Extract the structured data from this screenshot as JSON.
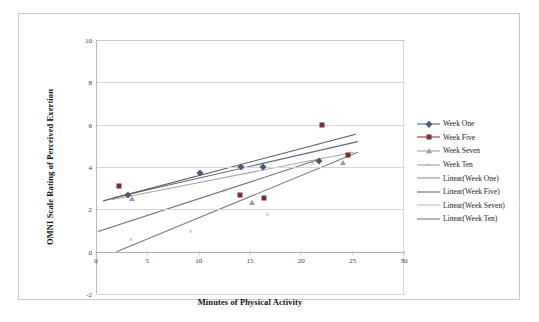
{
  "chart_data": {
    "type": "scatter",
    "title": "",
    "xlabel": "Minutes of Physical Activity",
    "ylabel": "OMNI Scale Rating of Perceived Exertion",
    "xlim": [
      0,
      30
    ],
    "ylim": [
      -2,
      10
    ],
    "xticks": [
      "0",
      "5",
      "10",
      "15",
      "20",
      "25",
      "30"
    ],
    "yticks": [
      "10",
      "8",
      "6",
      "4",
      "2",
      "0",
      "-2"
    ],
    "grid": "horizontal",
    "legend_position": "right",
    "series": [
      {
        "name": "Week One",
        "marker": "diamond",
        "color": "#4a5a76",
        "points": [
          {
            "x": 3.0,
            "y": 2.7
          },
          {
            "x": 10.0,
            "y": 3.7
          },
          {
            "x": 14.0,
            "y": 4.0
          },
          {
            "x": 16.2,
            "y": 4.0
          },
          {
            "x": 21.6,
            "y": 4.3
          }
        ]
      },
      {
        "name": "Week Five",
        "marker": "square",
        "color": "#7d2d33",
        "points": [
          {
            "x": 2.1,
            "y": 3.1
          },
          {
            "x": 13.9,
            "y": 2.7
          },
          {
            "x": 16.3,
            "y": 2.55
          },
          {
            "x": 21.9,
            "y": 6.0
          },
          {
            "x": 24.4,
            "y": 4.55
          }
        ]
      },
      {
        "name": "Week Seven",
        "marker": "triangle",
        "color": "#9a9a9a",
        "points": [
          {
            "x": 3.4,
            "y": 2.5
          },
          {
            "x": 15.1,
            "y": 2.3
          },
          {
            "x": 24.0,
            "y": 4.2
          }
        ]
      },
      {
        "name": "Week Ten",
        "marker": "cross",
        "color": "#8f8fae",
        "points": [
          {
            "x": 3.3,
            "y": 0.6
          },
          {
            "x": 9.1,
            "y": 1.0
          },
          {
            "x": 12.4,
            "y": 2.9
          },
          {
            "x": 16.6,
            "y": 1.8
          },
          {
            "x": 21.0,
            "y": 4.2
          }
        ]
      }
    ],
    "trendlines": [
      {
        "name": "Linear(Week One)",
        "color": "#586a88",
        "x1": 1.6,
        "y1": 2.55,
        "x2": 25.4,
        "y2": 5.2
      },
      {
        "name": "Linear(Week Five)",
        "color": "#5b5b5b",
        "x1": 0.6,
        "y1": 2.4,
        "x2": 25.2,
        "y2": 5.55
      },
      {
        "name": "Linear(Week Seven)",
        "color": "#a8a8a8",
        "x1": 1.4,
        "y1": 2.45,
        "x2": 25.0,
        "y2": 4.7
      },
      {
        "name": "Linear(Week Ten)",
        "color": "#7b7b7b",
        "x1": 1.9,
        "y1": 0.0,
        "x2": 25.4,
        "y2": 4.7
      },
      {
        "name": "Linear(Week Ten) second",
        "color": "#6e6e6e",
        "x1": 0.1,
        "y1": 0.95,
        "x2": 21.6,
        "y2": 4.35
      }
    ]
  },
  "legend": {
    "entries": [
      {
        "label": "Week One",
        "kind": "marker",
        "marker": "diamond",
        "color": "#4a5a76"
      },
      {
        "label": "Week Five",
        "kind": "marker",
        "marker": "square",
        "color": "#7d2d33"
      },
      {
        "label": "Week Seven",
        "kind": "marker",
        "marker": "triangle",
        "color": "#9a9a9a"
      },
      {
        "label": "Week Ten",
        "kind": "marker",
        "marker": "cross",
        "color": "#8f8fae"
      },
      {
        "label": "Linear(Week One)",
        "kind": "line",
        "color": "#7d8aa3"
      },
      {
        "label": "Linear(Week Five)",
        "kind": "line",
        "color": "#5b5b5b"
      },
      {
        "label": "Linear(Week Seven)",
        "kind": "line",
        "color": "#b4b4b4"
      },
      {
        "label": "Linear(Week Ten)",
        "kind": "line",
        "color": "#6e6e6e"
      }
    ]
  }
}
